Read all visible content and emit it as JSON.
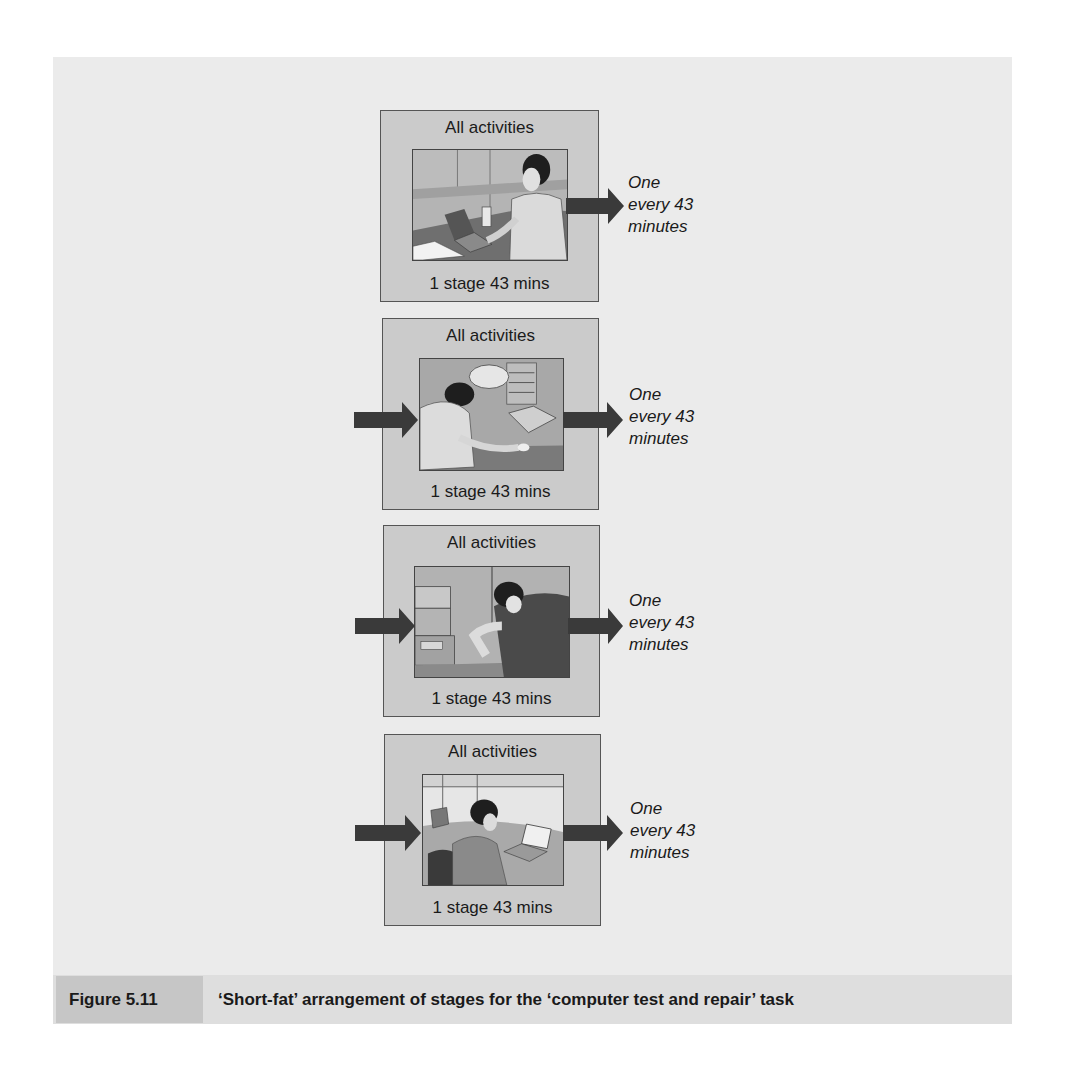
{
  "figure": {
    "number": "Figure 5.11",
    "caption": "‘Short-fat’ arrangement of stages for the ‘computer test and repair’ task"
  },
  "stages": [
    {
      "title": "All activities",
      "label": "1 stage 43 mins",
      "has_input_arrow": false,
      "output_rate": [
        "One",
        "every 43",
        "minutes"
      ],
      "photo": "technician-at-laptop-standing"
    },
    {
      "title": "All activities",
      "label": "1 stage 43 mins",
      "has_input_arrow": true,
      "output_rate": [
        "One",
        "every 43",
        "minutes"
      ],
      "photo": "technician-repairing-hardware"
    },
    {
      "title": "All activities",
      "label": "1 stage 43 mins",
      "has_input_arrow": true,
      "output_rate": [
        "One",
        "every 43",
        "minutes"
      ],
      "photo": "technician-testing-equipment"
    },
    {
      "title": "All activities",
      "label": "1 stage 43 mins",
      "has_input_arrow": true,
      "output_rate": [
        "One",
        "every 43",
        "minutes"
      ],
      "photo": "operator-with-headset-at-laptop"
    }
  ],
  "colors": {
    "panel_bg": "#ebebeb",
    "box_fill": "#cbcbcb",
    "arrow": "#3a3a3a",
    "caption_bar": "#dedede",
    "caption_label": "#c6c6c6"
  }
}
